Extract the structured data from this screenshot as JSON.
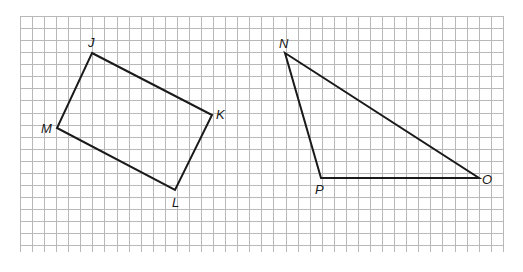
{
  "figure": {
    "grid": {
      "left": 20,
      "top": 16,
      "right": 503,
      "bottom": 252,
      "spacing": 12.07,
      "color": "#b8b8b8"
    },
    "line_color": "#1a1a1a",
    "shapes": [
      {
        "name": "rectangle-JKLM",
        "type": "quadrilateral",
        "vertices": [
          {
            "label": "J",
            "x": 92,
            "y": 53,
            "label_dx": -4,
            "label_dy": -6
          },
          {
            "label": "K",
            "x": 212,
            "y": 115,
            "label_dx": 4,
            "label_dy": 4
          },
          {
            "label": "L",
            "x": 175,
            "y": 190,
            "label_dx": -3,
            "label_dy": 17
          },
          {
            "label": "M",
            "x": 57,
            "y": 128,
            "label_dx": -16,
            "label_dy": 5
          }
        ]
      },
      {
        "name": "triangle-NOP",
        "type": "triangle",
        "vertices": [
          {
            "label": "N",
            "x": 285,
            "y": 53,
            "label_dx": -6,
            "label_dy": -5
          },
          {
            "label": "O",
            "x": 479,
            "y": 178,
            "label_dx": 3,
            "label_dy": 6
          },
          {
            "label": "P",
            "x": 321,
            "y": 178,
            "label_dx": -6,
            "label_dy": 16
          }
        ]
      }
    ]
  }
}
